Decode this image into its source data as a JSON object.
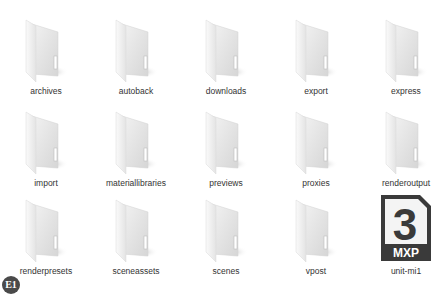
{
  "items": [
    {
      "name": "archives",
      "type": "folder"
    },
    {
      "name": "autoback",
      "type": "folder"
    },
    {
      "name": "downloads",
      "type": "folder"
    },
    {
      "name": "export",
      "type": "folder"
    },
    {
      "name": "express",
      "type": "folder"
    },
    {
      "name": "import",
      "type": "folder"
    },
    {
      "name": "materiallibraries",
      "type": "folder"
    },
    {
      "name": "previews",
      "type": "folder"
    },
    {
      "name": "proxies",
      "type": "folder"
    },
    {
      "name": "renderoutput",
      "type": "folder"
    },
    {
      "name": "renderpresets",
      "type": "folder"
    },
    {
      "name": "sceneassets",
      "type": "folder"
    },
    {
      "name": "scenes",
      "type": "folder"
    },
    {
      "name": "vpost",
      "type": "folder"
    },
    {
      "name": "unit-mi1",
      "type": "mxp-file",
      "icon_digit": "3",
      "icon_ext": "MXP"
    }
  ],
  "badge": {
    "text": "E1"
  },
  "colors": {
    "mxp_icon": "#3a3a3a",
    "mxp_text": "#ffffff",
    "folder": "#e6e6e6"
  }
}
